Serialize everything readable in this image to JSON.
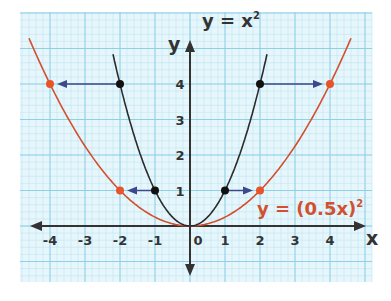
{
  "chart_data": {
    "type": "line",
    "title": "",
    "xlabel": "x",
    "ylabel": "y",
    "xlim": [
      -4.6,
      4.8
    ],
    "ylim": [
      -1.5,
      6.0
    ],
    "grid": true,
    "x_ticks": [
      "-4",
      "-3",
      "-2",
      "-1",
      "0",
      "1",
      "2",
      "3",
      "4"
    ],
    "y_ticks": [
      "1",
      "2",
      "3",
      "4"
    ],
    "series": [
      {
        "name": "y = x²",
        "label_text": "y = x",
        "label_exp": "2",
        "color": "#2b2b2b",
        "function": "x^2",
        "x_range": [
          -2.2,
          2.2
        ],
        "marked_points": [
          [
            -2,
            4
          ],
          [
            -1,
            1
          ],
          [
            1,
            1
          ],
          [
            2,
            4
          ]
        ]
      },
      {
        "name": "y = (0.5x)²",
        "label_text": "y = (0.5x)",
        "label_exp": "2",
        "color": "#d2502e",
        "function": "(0.5x)^2",
        "x_range": [
          -4.6,
          4.6
        ],
        "marked_points": [
          [
            -4,
            4
          ],
          [
            -2,
            1
          ],
          [
            2,
            1
          ],
          [
            4,
            4
          ]
        ]
      }
    ],
    "annotations": [
      {
        "type": "arrow",
        "from": [
          -2,
          4
        ],
        "to": [
          -4,
          4
        ],
        "color": "#3a4a8c"
      },
      {
        "type": "arrow",
        "from": [
          -1,
          1
        ],
        "to": [
          -2,
          1
        ],
        "color": "#3a4a8c"
      },
      {
        "type": "arrow",
        "from": [
          1,
          1
        ],
        "to": [
          2,
          1
        ],
        "color": "#3a4a8c"
      },
      {
        "type": "arrow",
        "from": [
          2,
          4
        ],
        "to": [
          4,
          4
        ],
        "color": "#3a4a8c"
      }
    ]
  },
  "colors": {
    "grid_bg": "#e6f6fb",
    "grid_minor": "#b9e3f0",
    "grid_major": "#8fd0e6",
    "axis": "#333333",
    "curve_black": "#2b2b2b",
    "curve_red": "#d2502e",
    "arrow": "#3a4a8c"
  }
}
